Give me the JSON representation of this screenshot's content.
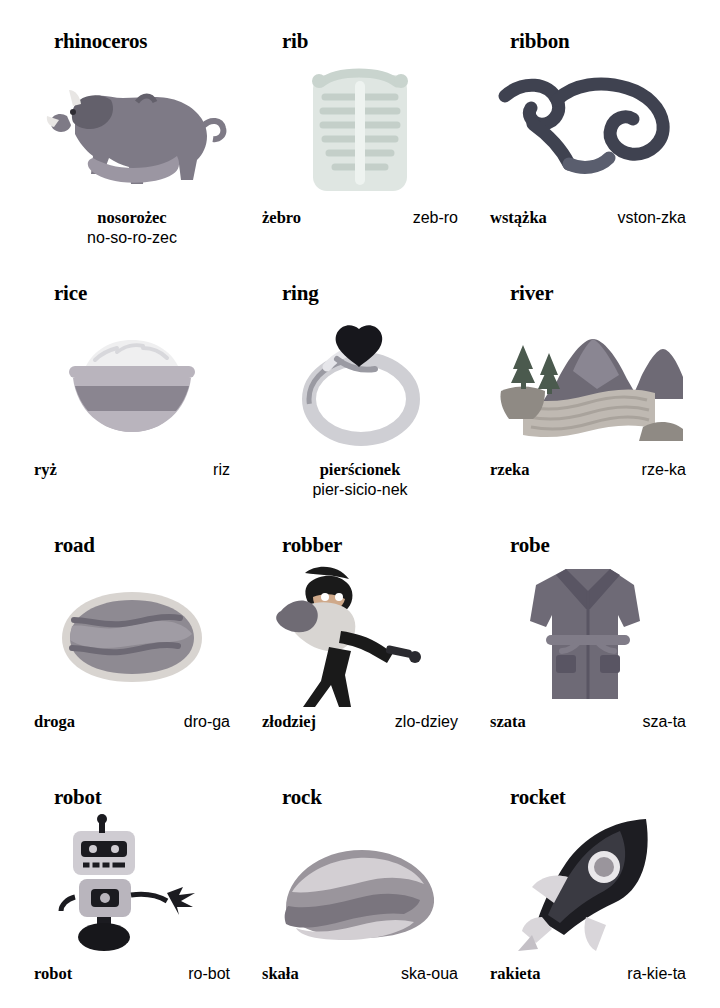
{
  "page": {
    "columns": 3,
    "rows": 4
  },
  "entries": [
    {
      "id": "rhinoceros",
      "headword": "rhinoceros",
      "polish": "nosorożec",
      "syllables": "no-so-ro-zec",
      "layout": "stacked",
      "icon": "rhinoceros-illustration",
      "colors": {
        "body": "#7e7a86",
        "belly": "#9b96a2",
        "horn": "#e8e6e4",
        "shade": "#63606b"
      }
    },
    {
      "id": "rib",
      "headword": "rib",
      "polish": "żebro",
      "syllables": "zeb-ro",
      "layout": "row",
      "icon": "rib-cage-illustration",
      "colors": {
        "bone": "#dfe6e2",
        "outline": "#aab8b2",
        "shade": "#c4cfc9"
      }
    },
    {
      "id": "ribbon",
      "headword": "ribbon",
      "polish": "wstążka",
      "syllables": "vston-zka",
      "layout": "row",
      "icon": "ribbon-illustration",
      "colors": {
        "ribbon": "#3f4250",
        "highlight": "#5a5e6e"
      }
    },
    {
      "id": "rice",
      "headword": "rice",
      "polish": "ryż",
      "syllables": "riz",
      "layout": "row",
      "icon": "rice-bowl-illustration",
      "colors": {
        "bowl": "#8a8590",
        "bowlLight": "#b9b4bd",
        "rice": "#efeff0"
      }
    },
    {
      "id": "ring",
      "headword": "ring",
      "polish": "pierścionek",
      "syllables": "pier-sicio-nek",
      "layout": "stacked",
      "icon": "ring-illustration",
      "colors": {
        "band": "#cfcfd4",
        "bandShade": "#9a9aa2",
        "stone": "#17171c"
      }
    },
    {
      "id": "river",
      "headword": "river",
      "polish": "rzeka",
      "syllables": "rze-ka",
      "layout": "row",
      "icon": "river-landscape-illustration",
      "colors": {
        "hills": "#6e6a75",
        "water": "#bfb9b2",
        "trees": "#4b5a4e",
        "bank": "#8f8a84"
      }
    },
    {
      "id": "road",
      "headword": "road",
      "polish": "droga",
      "syllables": "dro-ga",
      "layout": "row",
      "icon": "road-illustration",
      "colors": {
        "asphalt": "#8e8a92",
        "edge": "#d8d4d0",
        "line": "#6d6974"
      }
    },
    {
      "id": "robber",
      "headword": "robber",
      "polish": "złodziej",
      "syllables": "zlo-dziey",
      "layout": "row",
      "icon": "robber-illustration",
      "colors": {
        "mask": "#1a1a1a",
        "shirt": "#d8d5d2",
        "bag": "#6f6b74",
        "skin": "#cfa98a"
      }
    },
    {
      "id": "robe",
      "headword": "robe",
      "polish": "szata",
      "syllables": "sza-ta",
      "layout": "row",
      "icon": "robe-illustration",
      "colors": {
        "fabric": "#6e6a76",
        "fabricDark": "#595563",
        "belt": "#807c88"
      }
    },
    {
      "id": "robot",
      "headword": "robot",
      "polish": "robot",
      "syllables": "ro-bot",
      "layout": "row",
      "icon": "robot-illustration",
      "colors": {
        "body": "#b9b5bd",
        "head": "#cfccd2",
        "dark": "#1b1b20",
        "base": "#17171b"
      }
    },
    {
      "id": "rock",
      "headword": "rock",
      "polish": "skała",
      "syllables": "ska-oua",
      "layout": "row",
      "icon": "rock-illustration",
      "colors": {
        "stone": "#9a959c",
        "stoneLight": "#d3cfd3",
        "stoneDark": "#7a757e"
      }
    },
    {
      "id": "rocket",
      "headword": "rocket",
      "polish": "rakieta",
      "syllables": "ra-kie-ta",
      "layout": "row",
      "icon": "rocket-illustration",
      "colors": {
        "body": "#1d1d22",
        "fin": "#d9d6da",
        "window": "#e9e7ea",
        "nose": "#1d1d22"
      }
    }
  ]
}
